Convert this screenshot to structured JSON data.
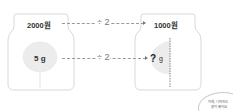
{
  "left_jar": {
    "price": "2000원",
    "weight": "5 g"
  },
  "right_jar": {
    "price": "1000원",
    "weight_unknown": "?",
    "weight_unit": "g"
  },
  "arrows": {
    "top_operation": "÷ 2",
    "bottom_operation": "÷ 2"
  },
  "speech_bubble": {
    "line1": "어제, 나머지도",
    "line2": "같이 왔어요"
  },
  "colors": {
    "jar_outline": "#d9d9d9",
    "cotton": "#ececec",
    "dash": "#999999",
    "text": "#333333"
  }
}
